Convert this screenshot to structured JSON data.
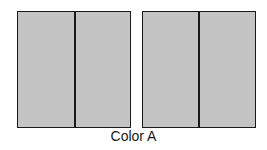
{
  "diagram": {
    "caption": "Color A",
    "fill_color": "#c4c4c4",
    "stroke_color": "#1a1a1a",
    "panels": [
      {
        "name": "left-panel",
        "halves": 2
      },
      {
        "name": "right-panel",
        "halves": 2
      }
    ]
  }
}
